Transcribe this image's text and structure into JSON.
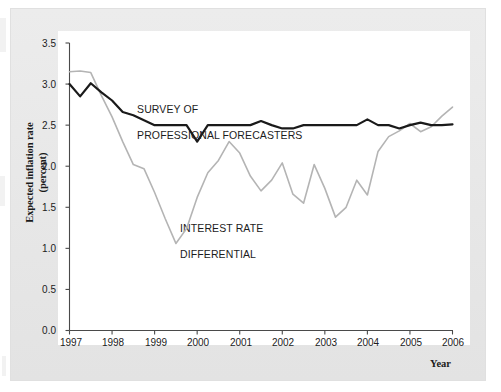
{
  "figure": {
    "background_color": "#e9e9e9",
    "plot_background_color": "#ffffff"
  },
  "axis": {
    "y_title_line1": "Expected inflation rate",
    "y_title_line2": "(percent)",
    "x_title": "Year",
    "y_ticks": [
      "0.0",
      "0.5",
      "1.0",
      "1.5",
      "2.0",
      "2.5",
      "3.0",
      "3.5"
    ],
    "x_ticks": [
      "1997",
      "1998",
      "1999",
      "2000",
      "2001",
      "2002",
      "2003",
      "2004",
      "2005",
      "2006"
    ]
  },
  "annotations": {
    "survey_line1": "SURVEY OF",
    "survey_line2": "PROFESSIONAL FORECASTERS",
    "differential_line1": "INTEREST RATE",
    "differential_line2": "DIFFERENTIAL"
  },
  "colors": {
    "survey_line": "#1a1a1a",
    "differential_line": "#b4b4b4",
    "axis": "#4a4a4a",
    "text": "#1c1c1c"
  },
  "chart_data": {
    "type": "line",
    "title": "",
    "xlabel": "Year",
    "ylabel": "Expected inflation rate (percent)",
    "xlim": [
      1997.0,
      2006.0
    ],
    "ylim": [
      0.0,
      3.5
    ],
    "yticks": [
      0.0,
      0.5,
      1.0,
      1.5,
      2.0,
      2.5,
      3.0,
      3.5
    ],
    "xticks": [
      1997,
      1998,
      1999,
      2000,
      2001,
      2002,
      2003,
      2004,
      2005,
      2006
    ],
    "grid": false,
    "legend": "inline-annotations",
    "x": [
      1997.0,
      1997.25,
      1997.5,
      1997.75,
      1998.0,
      1998.25,
      1998.5,
      1998.75,
      1999.0,
      1999.25,
      1999.5,
      1999.75,
      2000.0,
      2000.25,
      2000.5,
      2000.75,
      2001.0,
      2001.25,
      2001.5,
      2001.75,
      2002.0,
      2002.25,
      2002.5,
      2002.75,
      2003.0,
      2003.25,
      2003.5,
      2003.75,
      2004.0,
      2004.25,
      2004.5,
      2004.75,
      2005.0,
      2005.25,
      2005.5,
      2005.75,
      2006.0
    ],
    "series": [
      {
        "name": "SURVEY OF PROFESSIONAL FORECASTERS",
        "color": "#1a1a1a",
        "linewidth": 2.2,
        "values": [
          3.0,
          2.85,
          3.01,
          2.9,
          2.8,
          2.66,
          2.62,
          2.56,
          2.5,
          2.5,
          2.5,
          2.5,
          2.3,
          2.5,
          2.5,
          2.5,
          2.5,
          2.5,
          2.55,
          2.5,
          2.46,
          2.46,
          2.5,
          2.5,
          2.5,
          2.5,
          2.5,
          2.5,
          2.57,
          2.5,
          2.5,
          2.46,
          2.5,
          2.53,
          2.5,
          2.5,
          2.51
        ]
      },
      {
        "name": "INTEREST RATE DIFFERENTIAL",
        "color": "#b4b4b4",
        "linewidth": 1.6,
        "values": [
          3.15,
          3.16,
          3.14,
          2.86,
          2.6,
          2.3,
          2.02,
          1.97,
          1.68,
          1.36,
          1.06,
          1.24,
          1.62,
          1.92,
          2.07,
          2.3,
          2.16,
          1.88,
          1.7,
          1.83,
          2.04,
          1.66,
          1.55,
          2.02,
          1.73,
          1.38,
          1.5,
          1.83,
          1.65,
          2.18,
          2.36,
          2.43,
          2.52,
          2.42,
          2.48,
          2.61,
          2.72
        ]
      }
    ]
  }
}
